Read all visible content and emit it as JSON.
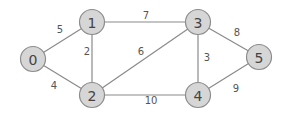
{
  "graph": {
    "type": "weighted-undirected",
    "nodes": [
      {
        "id": "0",
        "label": "0",
        "x": 33,
        "y": 59
      },
      {
        "id": "1",
        "label": "1",
        "x": 92,
        "y": 22
      },
      {
        "id": "2",
        "label": "2",
        "x": 92,
        "y": 95
      },
      {
        "id": "3",
        "label": "3",
        "x": 198,
        "y": 22
      },
      {
        "id": "4",
        "label": "4",
        "x": 198,
        "y": 95
      },
      {
        "id": "5",
        "label": "5",
        "x": 259,
        "y": 57
      }
    ],
    "edges": [
      {
        "from": "0",
        "to": "1",
        "weight": "5",
        "lx": 60,
        "ly": 29
      },
      {
        "from": "0",
        "to": "2",
        "weight": "4",
        "lx": 54,
        "ly": 85
      },
      {
        "from": "1",
        "to": "2",
        "weight": "2",
        "lx": 87,
        "ly": 51
      },
      {
        "from": "1",
        "to": "3",
        "weight": "7",
        "lx": 146,
        "ly": 15
      },
      {
        "from": "2",
        "to": "3",
        "weight": "6",
        "lx": 141,
        "ly": 51
      },
      {
        "from": "2",
        "to": "4",
        "weight": "10",
        "lx": 151,
        "ly": 100
      },
      {
        "from": "3",
        "to": "4",
        "weight": "3",
        "lx": 207,
        "ly": 57
      },
      {
        "from": "3",
        "to": "5",
        "weight": "8",
        "lx": 237,
        "ly": 32
      },
      {
        "from": "4",
        "to": "5",
        "weight": "9",
        "lx": 236,
        "ly": 88
      }
    ],
    "colors": {
      "node_fill": "#d6d6d6",
      "node_stroke": "#8c8c8c",
      "edge": "#8a8a8a",
      "text": "#444444"
    }
  }
}
